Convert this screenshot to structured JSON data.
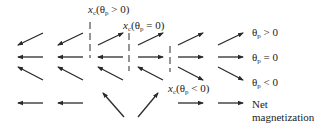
{
  "diagram": {
    "title": "",
    "color": "#2a2a2a",
    "columns_x": [
      [
        18,
        43
      ],
      [
        58,
        83
      ],
      [
        98,
        123
      ],
      [
        138,
        163
      ],
      [
        178,
        203
      ],
      [
        218,
        243
      ]
    ],
    "rows": [
      {
        "name": "theta-p-positive",
        "label_symbol": "θ",
        "label_sub": "p",
        "label_rel": " > 0",
        "label_x": 252,
        "label_y": 31,
        "y_top": 33,
        "y_bottom": 45,
        "arrows": [
          "down-left",
          "down-left",
          "up-right",
          "up-right",
          "up-right",
          "up-right"
        ]
      },
      {
        "name": "theta-p-zero",
        "label_symbol": "θ",
        "label_sub": "p",
        "label_rel": " = 0",
        "label_x": 252,
        "label_y": 51,
        "y_top": 57,
        "y_bottom": 57,
        "arrows": [
          "left",
          "left",
          "left",
          "right",
          "right",
          "right"
        ]
      },
      {
        "name": "theta-p-negative",
        "label_symbol": "θ",
        "label_sub": "p",
        "label_rel": " < 0",
        "label_x": 252,
        "label_y": 71,
        "y_top": 67,
        "y_bottom": 80,
        "arrows": [
          "up-left",
          "up-left",
          "up-left",
          "up-left",
          "down-right",
          "down-right"
        ]
      },
      {
        "name": "net-magnetization",
        "label_line1": "Net",
        "label_line2": "magnetization",
        "label_x": 252,
        "label_y": 98,
        "y_top": 103,
        "y_bottom": 103,
        "arrows": [
          "left",
          "left",
          "net-up-left",
          "net-up-right",
          "right",
          "right"
        ]
      }
    ],
    "critical_lines": [
      {
        "name": "xc-theta-p-positive",
        "x": 90,
        "y1": 22,
        "y2": 58,
        "label_var": "x",
        "label_sub": "c",
        "label_arg": "(θ",
        "label_arg_sub": "p",
        "label_rel": " > 0)",
        "label_x": 88,
        "label_y": 9
      },
      {
        "name": "xc-theta-p-zero",
        "x": 129,
        "y1": 33,
        "y2": 71,
        "label_var": "x",
        "label_sub": "c",
        "label_arg": "(θ",
        "label_arg_sub": "p",
        "label_rel": " = 0)",
        "label_x": 123,
        "label_y": 21
      },
      {
        "name": "xc-theta-p-negative",
        "x": 170,
        "y1": 46,
        "y2": 72,
        "label_var": "x",
        "label_sub": "c",
        "label_arg": "(θ",
        "label_arg_sub": "p",
        "label_rel": " < 0)",
        "label_x": 168,
        "label_y": 84
      }
    ]
  }
}
